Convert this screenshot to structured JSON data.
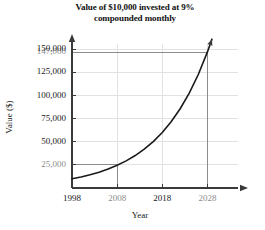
{
  "chart_data": {
    "type": "line",
    "title": "Value of $10,000 invested at 9% compounded monthly",
    "title_line1": "Value of $10,000 invested at 9%",
    "title_line2": "compounded monthly",
    "xlabel": "Year",
    "ylabel": "Value ($)",
    "xlim": [
      1998,
      2033
    ],
    "ylim": [
      0,
      160000
    ],
    "grid": true,
    "legend": "none",
    "x_ticks": [
      {
        "value": 1998,
        "label": "1998",
        "muted": false
      },
      {
        "value": 2008,
        "label": "2008",
        "muted": true
      },
      {
        "value": 2018,
        "label": "2018",
        "muted": false
      },
      {
        "value": 2028,
        "label": "2028",
        "muted": true
      }
    ],
    "y_ticks": [
      {
        "value": 25000,
        "label": "25,000",
        "muted": true
      },
      {
        "value": 50000,
        "label": "50,000",
        "muted": false
      },
      {
        "value": 75000,
        "label": "75,000",
        "muted": false
      },
      {
        "value": 100000,
        "label": "100,000",
        "muted": false
      },
      {
        "value": 125000,
        "label": "125,000",
        "muted": false
      },
      {
        "value": 147000,
        "label": "147,000",
        "muted": true
      },
      {
        "value": 150000,
        "label": "150,000",
        "muted": false
      }
    ],
    "series": [
      {
        "name": "Value of $10,000 at 9% compounded monthly",
        "x": [
          1998,
          2000,
          2002,
          2004,
          2006,
          2008,
          2010,
          2012,
          2014,
          2016,
          2018,
          2020,
          2022,
          2024,
          2026,
          2028,
          2029
        ],
        "values": [
          10000,
          11964,
          14313,
          17123,
          20485,
          24506,
          29317,
          35072,
          41956,
          50191,
          60044,
          71830,
          85932,
          102804,
          122988,
          147136,
          160938
        ]
      }
    ],
    "reference_lines": [
      {
        "orientation": "horizontal",
        "value": 147000,
        "label": "147,000",
        "from_x": 1998,
        "to_x": 2028
      },
      {
        "orientation": "vertical",
        "value": 2028,
        "label": "2028",
        "from_y": 0,
        "to_y": 147000
      },
      {
        "orientation": "horizontal",
        "value": 25000,
        "label": "25,000",
        "from_x": 1998,
        "to_x": 2008
      },
      {
        "orientation": "vertical",
        "value": 2008,
        "label": "2008",
        "from_y": 0,
        "to_y": 25000
      }
    ],
    "annotations": [
      {
        "text": "147,000",
        "at_x": 2028,
        "at_y": 147000
      },
      {
        "text": "25,000",
        "at_x": 2008,
        "at_y": 25000
      }
    ],
    "colors": {
      "curve": "#1a1a1a",
      "axis": "#3a3a3a",
      "gridline": "#e2e2e2",
      "reference_line": "#8c8c8c",
      "text": "#1a1a1a",
      "muted_text": "#8c8c8c",
      "background": "#ffffff"
    }
  }
}
